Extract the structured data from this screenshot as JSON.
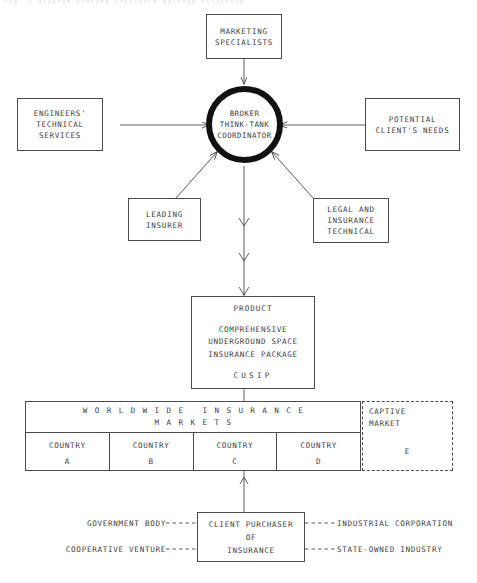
{
  "diagram": {
    "top_caption": "Fig. 1  Diagram showing insurance package structure",
    "nodes": {
      "marketing": {
        "lines": [
          "MARKETING",
          "SPECIALISTS"
        ]
      },
      "engineers": {
        "lines": [
          "ENGINEERS'",
          "TECHNICAL",
          "SERVICES"
        ]
      },
      "potential": {
        "lines": [
          "POTENTIAL",
          "CLIENT'S NEEDS"
        ]
      },
      "leading": {
        "lines": [
          "LEADING",
          "INSURER"
        ]
      },
      "legal": {
        "lines": [
          "LEGAL AND",
          "INSURANCE",
          "TECHNICAL"
        ]
      },
      "broker": {
        "lines": [
          "BROKER",
          "THINK-TANK",
          "COORDINATOR"
        ]
      },
      "product": {
        "title": "PRODUCT",
        "desc_lines": [
          "COMPREHENSIVE",
          "UNDERGROUND    SPACE",
          "INSURANCE  PACKAGE"
        ],
        "acronym": "CUSIP"
      },
      "client": {
        "lines": [
          "CLIENT PURCHASER",
          "OF",
          "INSURANCE"
        ]
      }
    },
    "markets_table": {
      "header_line1": "WORLDWIDE INSURANCE",
      "header_line2": "MARKETS",
      "columns": [
        {
          "label": "COUNTRY",
          "code": "A"
        },
        {
          "label": "COUNTRY",
          "code": "B"
        },
        {
          "label": "COUNTRY",
          "code": "C"
        },
        {
          "label": "COUNTRY",
          "code": "D"
        }
      ],
      "captive": {
        "line1": "CAPTIVE",
        "line2": "MARKET",
        "code": "E"
      }
    },
    "client_links": {
      "top_left": "GOVERNMENT BODY",
      "bottom_left": "COOPERATIVE VENTURE",
      "top_right": "INDUSTRIAL CORPORATION",
      "bottom_right": "STATE-OWNED INDUSTRY"
    },
    "colors": {
      "line": "#4a4a4a",
      "circle": "#111111",
      "text": "#3d3d3d",
      "background": "#ffffff"
    }
  }
}
